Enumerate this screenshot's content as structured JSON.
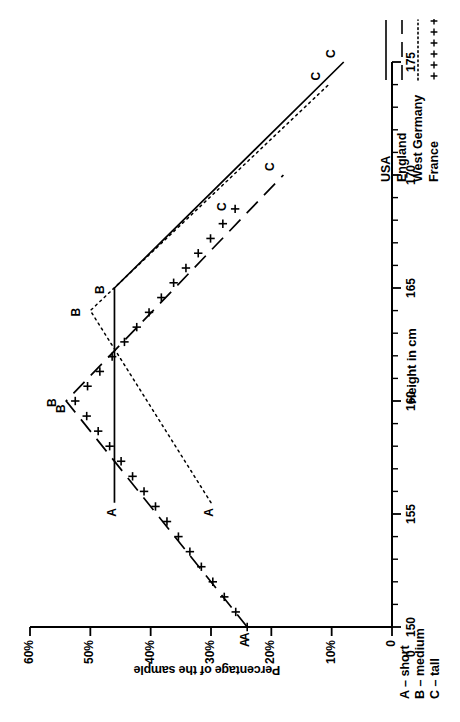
{
  "chart_data": {
    "type": "line",
    "title": "",
    "xlabel": "Height in cm",
    "ylabel": "Percentage of the sample",
    "xlim": [
      150,
      175
    ],
    "ylim": [
      0,
      60
    ],
    "x_ticks": [
      150,
      151,
      152,
      153,
      154,
      155,
      156,
      157,
      158,
      159,
      160,
      161,
      162,
      163,
      164,
      165,
      166,
      167,
      168,
      169,
      170,
      171,
      172,
      173,
      174,
      175
    ],
    "x_tick_labels": [
      "150",
      "",
      "",
      "",
      "",
      "155",
      "",
      "",
      "",
      "",
      "160",
      "",
      "",
      "",
      "",
      "165",
      "",
      "",
      "",
      "",
      "170",
      "",
      "",
      "",
      "",
      "175"
    ],
    "y_ticks": [
      0,
      10,
      20,
      30,
      40,
      50,
      60
    ],
    "y_tick_labels": [
      "0",
      "10%",
      "20%",
      "30%",
      "40%",
      "50%",
      "60%"
    ],
    "grid": false,
    "legend_position": "bottom-right",
    "origin_label": "0",
    "series": [
      {
        "name": "USA",
        "style": "solid",
        "color": "#000000",
        "points": [
          {
            "x": 155.5,
            "y": 46.0,
            "label": "A"
          },
          {
            "x": 165.0,
            "y": 46.0,
            "label": "B"
          },
          {
            "x": 175.0,
            "y": 8.0,
            "label": "C"
          }
        ]
      },
      {
        "name": "England",
        "style": "dashed",
        "color": "#000000",
        "points": [
          {
            "x": 150.0,
            "y": 24.0,
            "label": "A"
          },
          {
            "x": 160.0,
            "y": 54.0,
            "label": "B"
          },
          {
            "x": 170.0,
            "y": 18.0,
            "label": "C"
          }
        ]
      },
      {
        "name": "West Germany",
        "style": "dotted",
        "color": "#000000",
        "points": [
          {
            "x": 155.5,
            "y": 30.0,
            "label": "A"
          },
          {
            "x": 164.0,
            "y": 50.0,
            "label": "B"
          },
          {
            "x": 174.0,
            "y": 10.5,
            "label": "C"
          }
        ]
      },
      {
        "name": "France",
        "style": "cross-markers",
        "color": "#000000",
        "points": [
          {
            "x": 150.0,
            "y": 24.0,
            "label": "A"
          },
          {
            "x": 160.0,
            "y": 52.5,
            "label": "B"
          },
          {
            "x": 168.5,
            "y": 26.0,
            "label": "C"
          }
        ]
      }
    ],
    "category_key": [
      {
        "code": "A",
        "dash": "–",
        "meaning": "short",
        "text": "A – short"
      },
      {
        "code": "B",
        "dash": "–",
        "meaning": "medium",
        "text": "B – medium"
      },
      {
        "code": "C",
        "dash": "–",
        "meaning": "tall",
        "text": "C – tall"
      }
    ],
    "legend_entries": [
      {
        "name": "USA",
        "style": "solid"
      },
      {
        "name": "England",
        "style": "dashed"
      },
      {
        "name": "West Germany",
        "style": "dotted"
      },
      {
        "name": "France",
        "style": "cross-markers"
      }
    ]
  }
}
